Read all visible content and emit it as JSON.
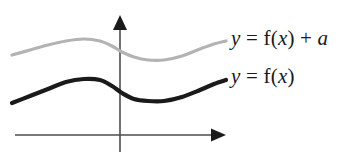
{
  "figure": {
    "name": "vertical-translation-of-a-function-graph",
    "background_color": "#ffffff"
  },
  "axes": {
    "x_axis": {
      "name": "x-axis",
      "color": "#4d4d4d",
      "start_x": 15,
      "end_x": 226,
      "y": 135,
      "arrow": "right"
    },
    "y_axis": {
      "name": "y-axis",
      "color": "#4d4d4d",
      "x": 120,
      "start_y": 152,
      "end_y": 15,
      "arrow": "up"
    }
  },
  "curves": [
    {
      "id": "shifted",
      "label_text": "y = f(x) + a",
      "color": "#b3b3b3",
      "stroke_width": 3.2,
      "description": "graph of f shifted up by a",
      "points": [
        [
          12,
          55
        ],
        [
          30,
          50
        ],
        [
          48,
          45
        ],
        [
          66,
          41
        ],
        [
          84,
          39
        ],
        [
          100,
          41
        ],
        [
          112,
          46
        ],
        [
          122,
          52
        ],
        [
          134,
          57
        ],
        [
          148,
          60
        ],
        [
          164,
          60
        ],
        [
          182,
          56
        ],
        [
          200,
          49
        ],
        [
          214,
          44
        ],
        [
          226,
          41
        ]
      ]
    },
    {
      "id": "base",
      "label_text": "y = f(x)",
      "color": "#1a1a1a",
      "stroke_width": 4.2,
      "description": "graph of f",
      "points": [
        [
          12,
          103
        ],
        [
          30,
          96
        ],
        [
          48,
          89
        ],
        [
          66,
          82
        ],
        [
          84,
          79
        ],
        [
          100,
          80
        ],
        [
          112,
          86
        ],
        [
          122,
          93
        ],
        [
          134,
          99
        ],
        [
          148,
          101
        ],
        [
          164,
          101
        ],
        [
          182,
          97
        ],
        [
          200,
          90
        ],
        [
          214,
          84
        ],
        [
          226,
          80
        ]
      ]
    }
  ],
  "labels": {
    "shifted": {
      "name": "label-y-equals-f-of-x-plus-a",
      "full_text": "y = f(x) + a",
      "parts": {
        "y": "y",
        "eq": " = ",
        "f": "f(",
        "x": "x",
        "close": ")",
        "plus": " + ",
        "a": "a"
      }
    },
    "base": {
      "name": "label-y-equals-f-of-x",
      "full_text": "y = f(x)",
      "parts": {
        "y": "y",
        "eq": " = ",
        "f": "f(",
        "x": "x",
        "close": ")"
      }
    }
  },
  "colors": {
    "axis": "#4d4d4d",
    "curve_shifted": "#b3b3b3",
    "curve_base": "#1a1a1a",
    "text": "#1a1a1a",
    "background": "#ffffff"
  }
}
